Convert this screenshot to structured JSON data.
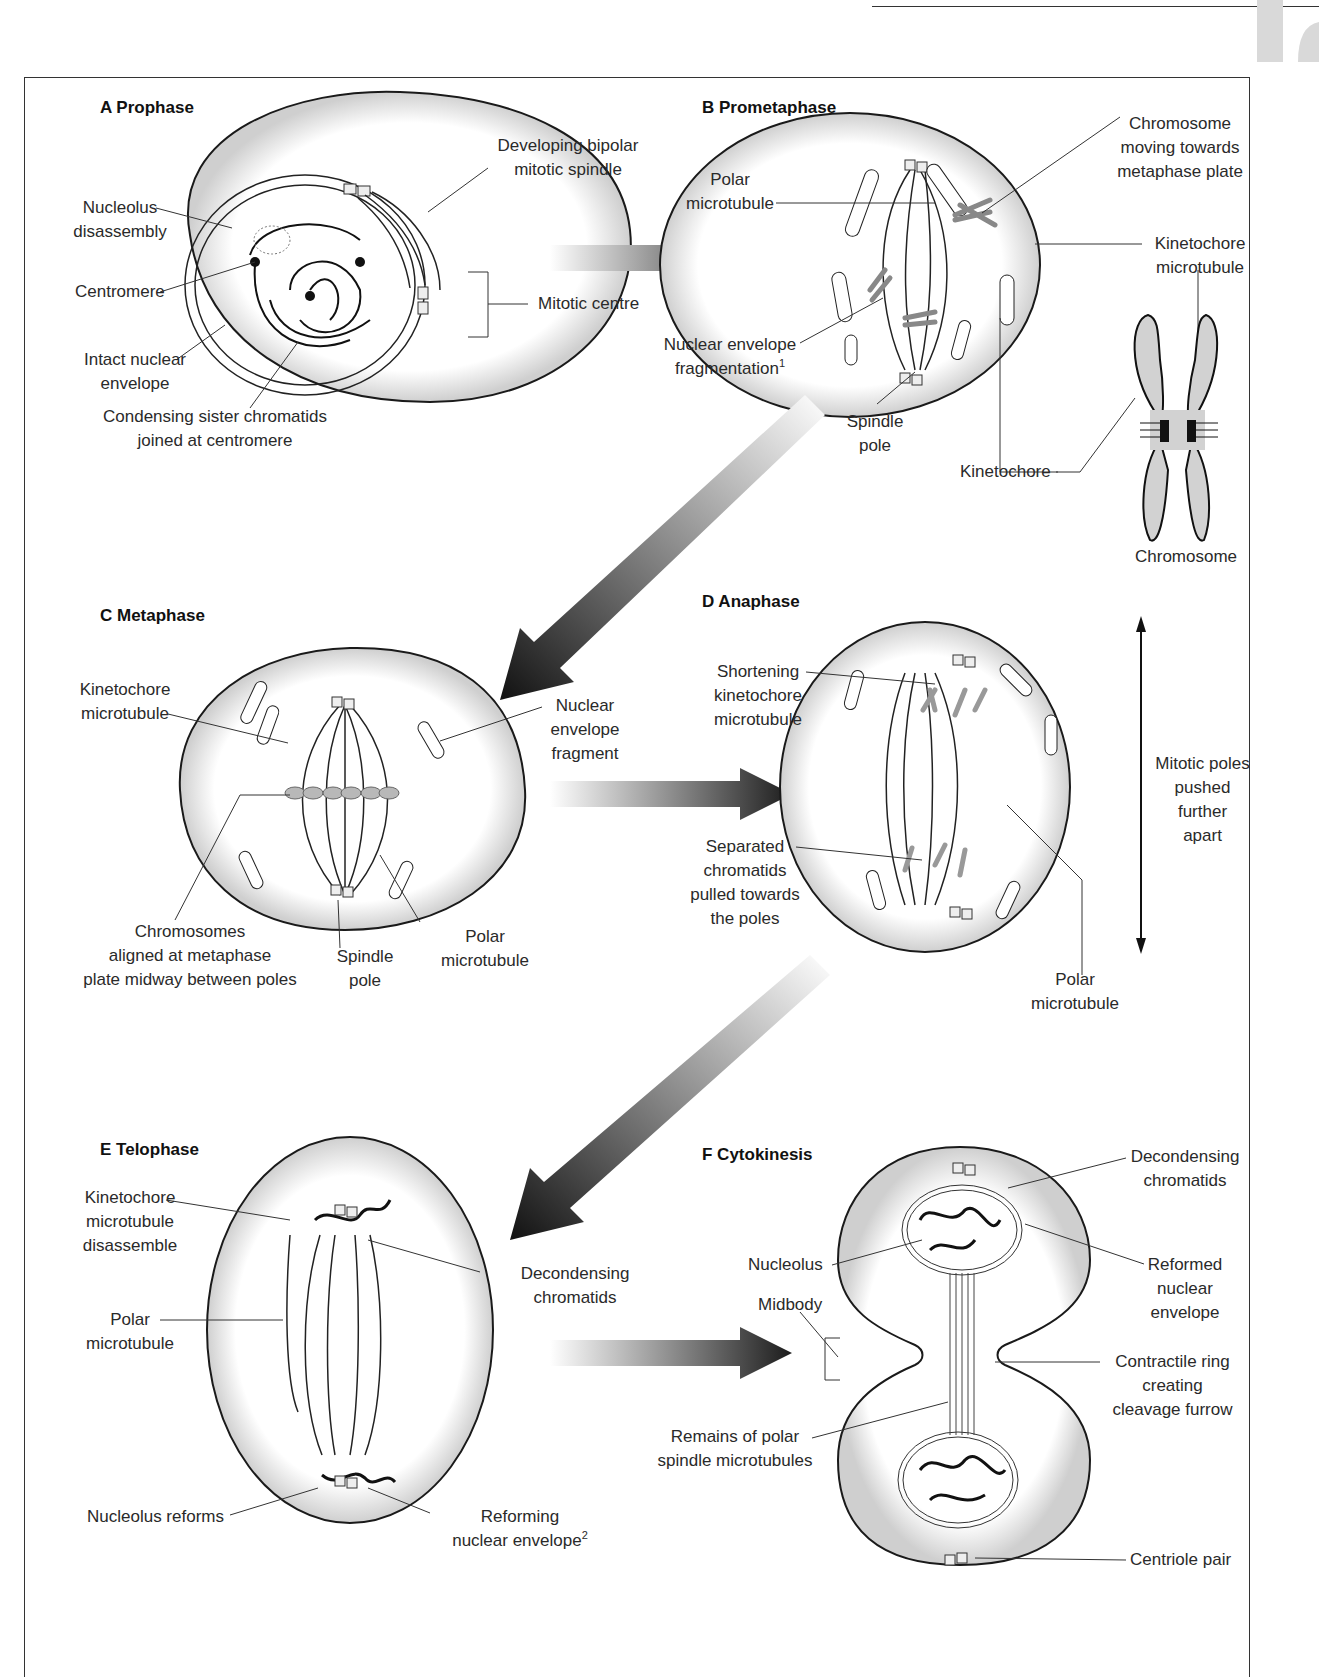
{
  "page": {
    "header_rule": true,
    "tab_marker": "gray-chapter-tab"
  },
  "panels": {
    "A": {
      "title": "A  Prophase",
      "labels": {
        "spindle": [
          "Developing bipolar",
          "mitotic spindle"
        ],
        "nucleolus": [
          "Nucleolus",
          "disassembly"
        ],
        "centromere": [
          "Centromere"
        ],
        "mitotic_centre": [
          "Mitotic centre"
        ],
        "envelope": [
          "Intact nuclear",
          "envelope"
        ],
        "chromatids": [
          "Condensing sister chromatids",
          "joined at centromere"
        ]
      }
    },
    "B": {
      "title": "B  Prometaphase",
      "labels": {
        "chromosome_moving": [
          "Chromosome",
          "moving towards",
          "metaphase plate"
        ],
        "polar": [
          "Polar",
          "microtubule"
        ],
        "kinetochore_mt": [
          "Kinetochore",
          "microtubule"
        ],
        "envelope_frag": [
          "Nuclear envelope",
          "fragmentation"
        ],
        "envelope_frag_sup": "1",
        "spindle_pole": [
          "Spindle",
          "pole"
        ],
        "kinetochore": [
          "Kinetochore"
        ],
        "chromosome": [
          "Chromosome"
        ]
      }
    },
    "C": {
      "title": "C  Metaphase",
      "labels": {
        "kinetochore_mt": [
          "Kinetochore",
          "microtubule"
        ],
        "envelope_fragment": [
          "Nuclear",
          "envelope",
          "fragment"
        ],
        "chromosomes": [
          "Chromosomes",
          "aligned at metaphase",
          "plate midway between poles"
        ],
        "spindle_pole": [
          "Spindle",
          "pole"
        ],
        "polar": [
          "Polar",
          "microtubule"
        ]
      }
    },
    "D": {
      "title": "D  Anaphase",
      "labels": {
        "shortening": [
          "Shortening",
          "kinetochore",
          "microtubule"
        ],
        "separated": [
          "Separated",
          "chromatids",
          "pulled towards",
          "the poles"
        ],
        "poles_apart": [
          "Mitotic poles",
          "pushed",
          "further",
          "apart"
        ],
        "polar": [
          "Polar",
          "microtubule"
        ]
      }
    },
    "E": {
      "title": "E  Telophase",
      "labels": {
        "kinetochore_dis": [
          "Kinetochore",
          "microtubule",
          "disassemble"
        ],
        "decondensing": [
          "Decondensing",
          "chromatids"
        ],
        "polar": [
          "Polar",
          "microtubule"
        ],
        "nucleolus_reforms": [
          "Nucleolus reforms"
        ],
        "reforming": [
          "Reforming",
          "nuclear envelope"
        ],
        "reforming_sup": "2"
      }
    },
    "F": {
      "title": "F  Cytokinesis",
      "labels": {
        "decondensing": [
          "Decondensing",
          "chromatids"
        ],
        "nucleolus": [
          "Nucleolus"
        ],
        "reformed": [
          "Reformed",
          "nuclear",
          "envelope"
        ],
        "midbody": [
          "Midbody"
        ],
        "contractile": [
          "Contractile ring",
          "creating",
          "cleavage furrow"
        ],
        "remains": [
          "Remains of polar",
          "spindle microtubules"
        ],
        "centriole": [
          "Centriole pair"
        ]
      }
    }
  },
  "arrows": [
    {
      "from": "A",
      "to": "B",
      "direction": "right"
    },
    {
      "from": "B",
      "to": "C",
      "direction": "down-left"
    },
    {
      "from": "C",
      "to": "D",
      "direction": "right"
    },
    {
      "from": "D",
      "to": "E",
      "direction": "down-left"
    },
    {
      "from": "E",
      "to": "F",
      "direction": "right"
    }
  ],
  "colors": {
    "outline": "#1a1a1a",
    "cell_fill": "#f4f4f4",
    "chromosome_fill": "#c9c9c9",
    "arrow_dark": "#1c1c1c",
    "frame": "#333333",
    "tab": "#d9d9d9"
  }
}
